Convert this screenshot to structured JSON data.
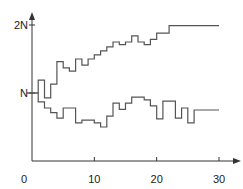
{
  "chart_data": {
    "type": "line",
    "step": true,
    "title": "",
    "xlabel": "",
    "ylabel": "",
    "xlim": [
      0,
      30
    ],
    "ylim": [
      0,
      2
    ],
    "x_ticks": [
      0,
      10,
      20,
      30
    ],
    "x_tick_labels": [
      "0",
      "10",
      "20",
      "30"
    ],
    "y_ticks": [
      1,
      2
    ],
    "y_tick_labels": [
      "N",
      "2N"
    ],
    "grid": false,
    "legend": null,
    "x": [
      0,
      1,
      2,
      3,
      4,
      5,
      6,
      7,
      8,
      9,
      10,
      11,
      12,
      13,
      14,
      15,
      16,
      17,
      18,
      19,
      20,
      21,
      22,
      23,
      24,
      25,
      26,
      27,
      28,
      29,
      30
    ],
    "series": [
      {
        "name": "upper",
        "values": [
          1.0,
          1.19,
          0.93,
          1.13,
          1.46,
          1.37,
          1.32,
          1.5,
          1.41,
          1.5,
          1.56,
          1.62,
          1.68,
          1.75,
          1.71,
          1.75,
          1.84,
          1.75,
          1.71,
          1.79,
          1.88,
          1.88,
          1.99,
          1.99,
          1.99,
          1.99,
          1.99,
          1.99,
          1.99,
          1.99,
          1.99
        ]
      },
      {
        "name": "lower",
        "values": [
          1.0,
          0.87,
          0.78,
          0.71,
          0.63,
          0.78,
          0.78,
          0.56,
          0.6,
          0.6,
          0.56,
          0.5,
          0.66,
          0.85,
          0.76,
          0.85,
          0.94,
          0.94,
          0.9,
          0.81,
          0.62,
          0.88,
          0.88,
          0.63,
          0.78,
          0.56,
          0.75,
          0.75,
          0.75,
          0.75,
          0.75
        ]
      }
    ],
    "color": "#555555"
  }
}
